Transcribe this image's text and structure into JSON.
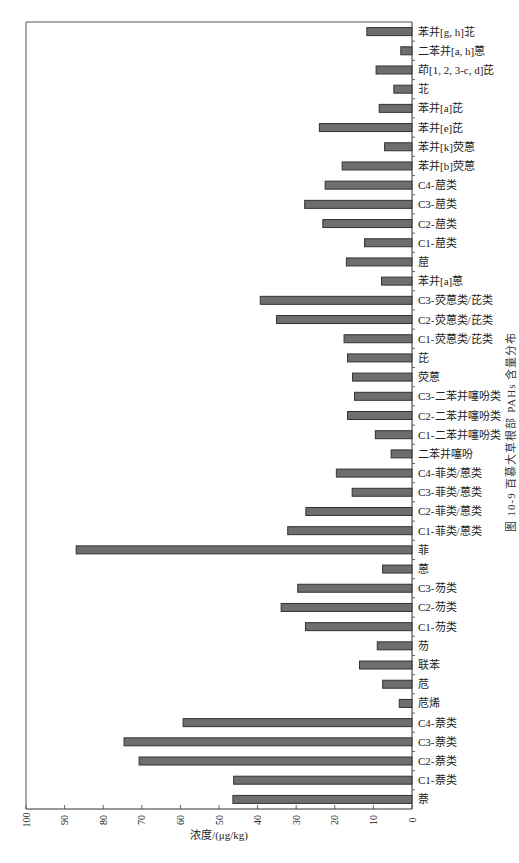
{
  "chart_data": {
    "type": "bar",
    "orientation": "horizontal",
    "title": "",
    "caption": "图 10-9   百慕大草根部 PAHs 含量分布",
    "xlabel": "浓度/(μg/kg)",
    "ylabel": "",
    "xlim": [
      0,
      100
    ],
    "x_axis_reversed": true,
    "xticks": [
      100,
      90,
      80,
      70,
      60,
      50,
      40,
      30,
      20,
      10,
      0
    ],
    "xtick_labels": [
      "100",
      "90",
      "80",
      "70",
      "60",
      "50",
      "40",
      "30",
      "20",
      "10",
      "0"
    ],
    "grid": false,
    "legend": null,
    "category_axis_side": "right",
    "bar_color": "#6e6e6e",
    "bar_edge_color": "#333333",
    "categories": [
      "苯并[g, h]苝",
      "二苯并[a, h]蒽",
      "茚[1, 2, 3-c, d]芘",
      "苝",
      "苯并[a]芘",
      "苯并[e]芘",
      "苯并[k]荧蒽",
      "苯并[b]荧蒽",
      "C4-䓛类",
      "C3-䓛类",
      "C2-䓛类",
      "C1-䓛类",
      "䓛",
      "苯并[a]蒽",
      "C3-荧蒽类/芘类",
      "C2-荧蒽类/芘类",
      "C1-荧蒽类/芘类",
      "芘",
      "荧蒽",
      "C3-二苯并噻吩类",
      "C2-二苯并噻吩类",
      "C1-二苯并噻吩类",
      "二苯并噻吩",
      "C4-菲类/蒽类",
      "C3-菲类/蒽类",
      "C2-菲类/蒽类",
      "C1-菲类/蒽类",
      "菲",
      "蒽",
      "C3-芴类",
      "C2-芴类",
      "C1-芴类",
      "芴",
      "联苯",
      "苊",
      "苊烯",
      "C4-萘类",
      "C3-萘类",
      "C2-萘类",
      "C1-萘类",
      "萘"
    ],
    "values": [
      11.7,
      2.9,
      9.3,
      4.7,
      8.5,
      24.0,
      7.1,
      18.1,
      22.5,
      27.8,
      23.1,
      12.3,
      17.0,
      7.9,
      39.3,
      35.1,
      17.6,
      16.7,
      15.4,
      14.9,
      16.7,
      9.5,
      5.4,
      19.6,
      15.5,
      27.5,
      32.2,
      87.0,
      7.6,
      29.6,
      33.9,
      27.6,
      9.0,
      13.6,
      7.6,
      3.3,
      59.3,
      74.6,
      70.7,
      46.2,
      46.4
    ]
  }
}
